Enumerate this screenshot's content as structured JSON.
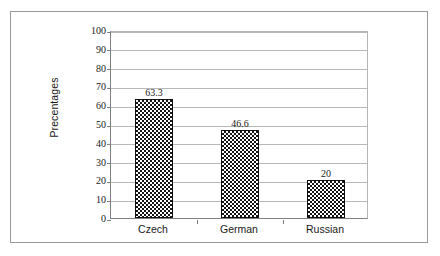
{
  "chart_data": {
    "type": "bar",
    "title": "",
    "subtitle": "",
    "xlabel": "",
    "ylabel": "Precentages",
    "categories": [
      "Czech",
      "German",
      "Russian"
    ],
    "values": [
      63.3,
      46.6,
      20
    ],
    "value_labels": [
      "63.3",
      "46.6",
      "20"
    ],
    "ylim": [
      0,
      100
    ],
    "ytick_step": 10,
    "ytick_labels": [
      "100",
      "90",
      "80",
      "70",
      "60",
      "50",
      "40",
      "30",
      "20",
      "10",
      "0"
    ],
    "ytick_values": [
      100,
      90,
      80,
      70,
      60,
      50,
      40,
      30,
      20,
      10,
      0
    ],
    "grid": "horizontal",
    "legend": "none",
    "series": [
      {
        "name": "Precentages",
        "values": [
          63.3,
          46.6,
          20
        ],
        "fill": "checkerboard",
        "fill_colors": [
          "#141414",
          "#ffffff"
        ],
        "edge_color": "#111111"
      }
    ]
  },
  "style": {
    "frame_color": "#9a9a9a",
    "gridline_color": "#b8b8b8",
    "axis_color": "#808080",
    "text_color": "#1a1a1a",
    "background": "#ffffff"
  }
}
